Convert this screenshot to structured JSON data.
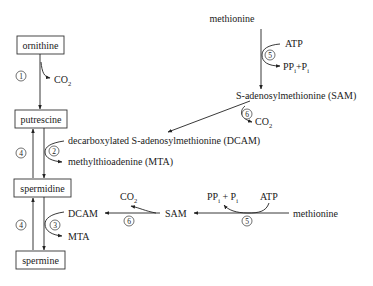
{
  "diagram": {
    "type": "metabolic-pathway",
    "nodes": {
      "ornithine": "ornithine",
      "putrescine": "putrescine",
      "spermidine": "spermidine",
      "spermine": "spermine",
      "methionine_top": "methionine",
      "sam_full": "S-adenosylmethionine (SAM)",
      "dcam_full": "decarboxylated S-adenosylmethionine (DCAM)",
      "mta_full": "methylthioadenine (MTA)",
      "dcam_short": "DCAM",
      "mta_short": "MTA",
      "sam_short": "SAM",
      "methionine_bottom": "methionine"
    },
    "cofactors": {
      "co2": "CO",
      "co2_sub": "2",
      "atp": "ATP",
      "pp": "PP",
      "pp_sub": "i",
      "plus": "+",
      "p": "P",
      "p_sub": "i",
      "plus_spaced": " + "
    },
    "enzyme_labels": {
      "e1": "1",
      "e2": "2",
      "e3": "3",
      "e4a": "4",
      "e4b": "4",
      "e5a": "5",
      "e5b": "5",
      "e6a": "6",
      "e6b": "6"
    },
    "edges": [
      {
        "from": "ornithine",
        "to": "putrescine",
        "enzyme": "1",
        "byproduct": "CO2"
      },
      {
        "from": "putrescine",
        "to": "spermidine",
        "enzyme": "2",
        "cosubstrate": "DCAM",
        "byproduct": "MTA"
      },
      {
        "from": "spermidine",
        "to": "putrescine",
        "enzyme": "4"
      },
      {
        "from": "spermidine",
        "to": "spermine",
        "enzyme": "3",
        "cosubstrate": "DCAM",
        "byproduct": "MTA"
      },
      {
        "from": "spermine",
        "to": "spermidine",
        "enzyme": "4"
      },
      {
        "from": "methionine",
        "to": "SAM",
        "enzyme": "5",
        "cosubstrate": "ATP",
        "byproduct": "PPi+Pi"
      },
      {
        "from": "SAM",
        "to": "DCAM",
        "enzyme": "6",
        "byproduct": "CO2"
      }
    ]
  }
}
